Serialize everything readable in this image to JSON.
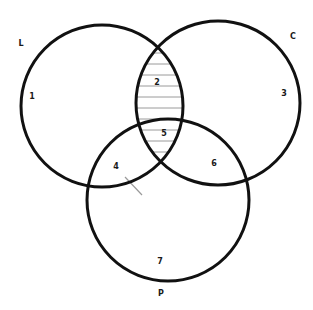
{
  "diagram": {
    "type": "venn",
    "sets": [
      {
        "id": "L",
        "label": "L",
        "cx": 102,
        "cy": 106,
        "r": 81,
        "label_pos": [
          21,
          44
        ]
      },
      {
        "id": "C",
        "label": "C",
        "cx": 218,
        "cy": 103,
        "r": 82,
        "label_pos": [
          293,
          37
        ]
      },
      {
        "id": "P",
        "label": "P",
        "cx": 168,
        "cy": 200,
        "r": 81,
        "label_pos": [
          161,
          294
        ]
      }
    ],
    "regions": [
      {
        "id": "1",
        "label": "1",
        "pos": [
          32,
          97
        ],
        "shaded": false
      },
      {
        "id": "2",
        "label": "2",
        "pos": [
          157,
          83
        ],
        "shaded": true
      },
      {
        "id": "3",
        "label": "3",
        "pos": [
          284,
          94
        ],
        "shaded": false
      },
      {
        "id": "4",
        "label": "4",
        "pos": [
          116,
          167
        ],
        "shaded": false
      },
      {
        "id": "5",
        "label": "5",
        "pos": [
          164,
          134
        ],
        "shaded": true
      },
      {
        "id": "6",
        "label": "6",
        "pos": [
          214,
          164
        ],
        "shaded": false
      },
      {
        "id": "7",
        "label": "7",
        "pos": [
          160,
          262
        ],
        "shaded": false
      }
    ],
    "shaded_region": "L ∩ C (regions 2 and 5)",
    "hatch": {
      "style": "horizontal-lines",
      "color": "#9a9a9a",
      "spacing": 11
    },
    "tick_mark": {
      "x1": 125,
      "y1": 177,
      "x2": 142,
      "y2": 195,
      "color": "#9a9a9a"
    },
    "stroke_color": "#111111"
  }
}
